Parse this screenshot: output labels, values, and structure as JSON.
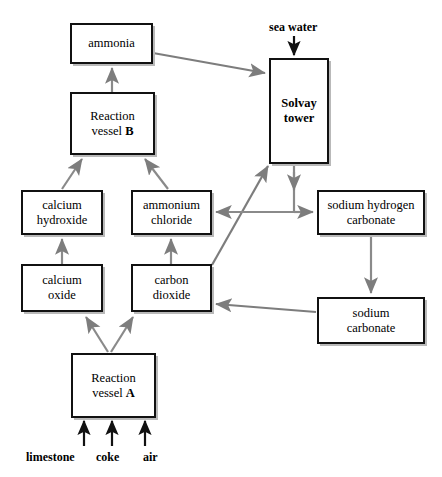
{
  "diagram": {
    "colors": {
      "box_border": "#111111",
      "box_fill": "#ffffff",
      "connector": "#808080",
      "connector_dark": "#6a6a6a",
      "shadow": "#b9b9b9",
      "text": "#000000",
      "background": "#ffffff"
    },
    "nodes": [
      {
        "id": "ammonia",
        "label": "ammonia",
        "x": 70,
        "y": 23,
        "w": 83,
        "h": 41,
        "bold": false
      },
      {
        "id": "vessel-b",
        "label": "Reaction\nvessel B",
        "x": 70,
        "y": 92,
        "w": 85,
        "h": 63,
        "bold": false
      },
      {
        "id": "solvay-tower",
        "label": "Solvay\ntower",
        "x": 269,
        "y": 58,
        "w": 60,
        "h": 106,
        "bold": true
      },
      {
        "id": "calcium-hydroxide",
        "label": "calcium\nhydroxide",
        "x": 21,
        "y": 190,
        "w": 82,
        "h": 45,
        "bold": false
      },
      {
        "id": "ammonium-chloride",
        "label": "ammonium\nchloride",
        "x": 131,
        "y": 190,
        "w": 81,
        "h": 45,
        "bold": false
      },
      {
        "id": "sodium-hydrogen-carbonate",
        "label": "sodium hydrogen\ncarbonate",
        "x": 317,
        "y": 190,
        "w": 108,
        "h": 45,
        "bold": false
      },
      {
        "id": "calcium-oxide",
        "label": "calcium\noxide",
        "x": 21,
        "y": 264,
        "w": 82,
        "h": 48,
        "bold": false
      },
      {
        "id": "carbon-dioxide",
        "label": "carbon\ndioxide",
        "x": 131,
        "y": 264,
        "w": 81,
        "h": 48,
        "bold": false
      },
      {
        "id": "sodium-carbonate",
        "label": "sodium\ncarbonate",
        "x": 317,
        "y": 297,
        "w": 108,
        "h": 47,
        "bold": false
      },
      {
        "id": "vessel-a",
        "label": "Reaction\nvessel A",
        "x": 71,
        "y": 353,
        "w": 85,
        "h": 65,
        "bold": false
      }
    ],
    "io_labels": [
      {
        "id": "sea-water",
        "label": "sea water",
        "x": 269,
        "y": 20
      },
      {
        "id": "limestone",
        "label": "limestone",
        "x": 26,
        "y": 450
      },
      {
        "id": "coke",
        "label": "coke",
        "x": 96,
        "y": 450
      },
      {
        "id": "air",
        "label": "air",
        "x": 143,
        "y": 450
      }
    ],
    "connections": [
      {
        "from": "vessel-b",
        "to": "ammonia",
        "type": "arrow-up"
      },
      {
        "from": "ammonia",
        "to": "solvay-tower",
        "type": "arrow-diagonal-right"
      },
      {
        "from": "sea-water",
        "to": "solvay-tower",
        "type": "arrow-down"
      },
      {
        "from": "calcium-hydroxide",
        "to": "vessel-b",
        "type": "arrow-diagonal-up-right"
      },
      {
        "from": "ammonium-chloride",
        "to": "vessel-b",
        "type": "arrow-diagonal-up-left"
      },
      {
        "from": "calcium-oxide",
        "to": "calcium-hydroxide",
        "type": "arrow-up"
      },
      {
        "from": "carbon-dioxide",
        "to": "ammonium-chloride",
        "type": "arrow-up"
      },
      {
        "from": "carbon-dioxide",
        "to": "solvay-tower",
        "type": "arrow-diagonal-up-right"
      },
      {
        "from": "solvay-tower",
        "to": "ammonium-chloride",
        "type": "arrow-down-then-left"
      },
      {
        "from": "solvay-tower",
        "to": "sodium-hydrogen-carbonate",
        "type": "arrow-down-then-right"
      },
      {
        "from": "sodium-hydrogen-carbonate",
        "to": "sodium-carbonate",
        "type": "arrow-down"
      },
      {
        "from": "sodium-carbonate",
        "to": "carbon-dioxide",
        "type": "arrow-left"
      },
      {
        "from": "vessel-a",
        "to": "calcium-oxide",
        "type": "arrow-diagonal-up-left"
      },
      {
        "from": "vessel-a",
        "to": "carbon-dioxide",
        "type": "arrow-diagonal-up-right"
      },
      {
        "from": "limestone",
        "to": "vessel-a",
        "type": "arrow-up"
      },
      {
        "from": "coke",
        "to": "vessel-a",
        "type": "arrow-up"
      },
      {
        "from": "air",
        "to": "vessel-a",
        "type": "arrow-up"
      }
    ]
  }
}
